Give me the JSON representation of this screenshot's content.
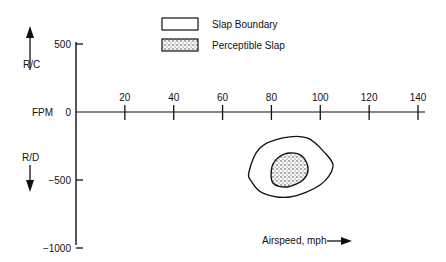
{
  "chart_data": {
    "type": "scatter",
    "title": "",
    "xlabel": "Airspeed, mph",
    "ylabel": "FPM",
    "y_upper_label": "R/C",
    "y_lower_label": "R/D",
    "xlim": [
      0,
      140
    ],
    "ylim": [
      -1000,
      500
    ],
    "x_ticks": [
      20,
      40,
      60,
      80,
      100,
      120,
      140
    ],
    "x_tick_labels": [
      "20",
      "40",
      "60",
      "80",
      "100",
      "120",
      "140"
    ],
    "y_ticks": [
      500,
      0,
      -500,
      -1000
    ],
    "y_tick_labels": [
      "500",
      "0",
      "−500",
      "−1000"
    ],
    "grid": false,
    "legend_position": "top-center",
    "legend": [
      {
        "label": "Slap Boundary",
        "style": "outline"
      },
      {
        "label": "Perceptible Slap",
        "style": "stippled"
      }
    ],
    "regions": [
      {
        "name": "Slap Boundary",
        "style": "outline",
        "points": [
          [
            70.8,
            -441
          ],
          [
            75.3,
            -265
          ],
          [
            84.7,
            -191
          ],
          [
            94.6,
            -191
          ],
          [
            101.9,
            -301
          ],
          [
            105.2,
            -404
          ],
          [
            99.9,
            -537
          ],
          [
            87.6,
            -625
          ],
          [
            76.5,
            -596
          ],
          [
            72.0,
            -515
          ]
        ]
      },
      {
        "name": "Perceptible Slap",
        "style": "stippled",
        "points": [
          [
            80.2,
            -404
          ],
          [
            83.1,
            -331
          ],
          [
            87.6,
            -301
          ],
          [
            92.5,
            -324
          ],
          [
            95.0,
            -412
          ],
          [
            92.9,
            -500
          ],
          [
            86.4,
            -551
          ],
          [
            80.6,
            -522
          ]
        ]
      }
    ]
  }
}
